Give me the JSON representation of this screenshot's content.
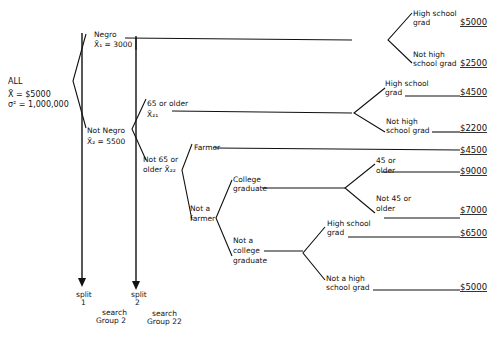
{
  "root": {
    "label": "ALL",
    "mean": "X̄ = $5000",
    "variance": "σ² = 1,000,000"
  },
  "split1": {
    "negro": {
      "label": "Negro",
      "mean": "X̄₁ = 3000",
      "children": [
        {
          "label_line1": "High school",
          "label_line2": "grad",
          "value": "$5000"
        },
        {
          "label_line1": "Not high",
          "label_line2": "school grad",
          "value": "$2500"
        }
      ]
    },
    "not_negro": {
      "label": "Not Negro",
      "mean": "X̄₂ = 5500"
    }
  },
  "split2": {
    "older": {
      "label_line1": "65 or older",
      "label_line2": "X̄₂₁",
      "children": [
        {
          "label_line1": "High school",
          "label_line2": "grad",
          "value": "$4500"
        },
        {
          "label_line1": "Not high",
          "label_line2": "school grad",
          "value": "$2200"
        }
      ]
    },
    "younger": {
      "label_line1": "Not 65 or",
      "label_line2": "older X̄₂₂",
      "farmer": {
        "label": "Farmer",
        "value": "$4500"
      },
      "not_farmer": {
        "label_line1": "Not a",
        "label_line2": "farmer",
        "college": {
          "label_line1": "College",
          "label_line2": "graduate",
          "children": [
            {
              "label_line1": "45 or",
              "label_line2": "older",
              "value": "$9000"
            },
            {
              "label_line1": "Not 45 or",
              "label_line2": "older",
              "value": "$7000"
            }
          ]
        },
        "not_college": {
          "label_line1": "Not a",
          "label_line2": "college",
          "label_line3": "graduate",
          "children": [
            {
              "label_line1": "High school",
              "label_line2": "grad",
              "value": "$6500"
            },
            {
              "label_line1": "Not a high",
              "label_line2": "school grad",
              "value": "$5000"
            }
          ]
        }
      }
    }
  },
  "footer": {
    "split1_line1": "split",
    "split1_line2": "1",
    "split2_line1": "split",
    "split2_line2": "2",
    "search_g2_line1": "search",
    "search_g2_line2": "Group 2",
    "search_g22_line1": "search",
    "search_g22_line2": "Group 22"
  }
}
